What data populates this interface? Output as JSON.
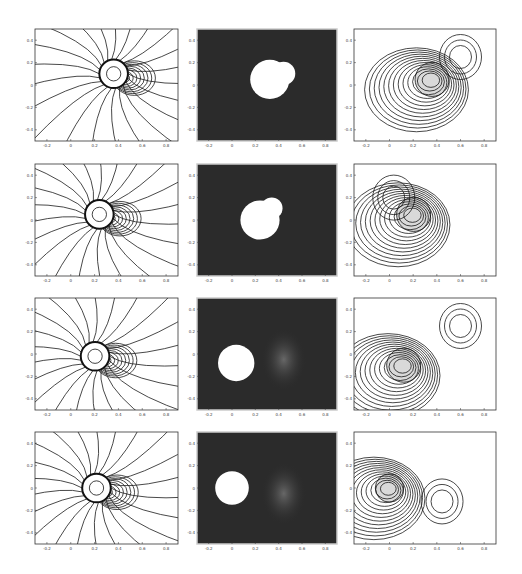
{
  "figure": {
    "layout": {
      "rows": 4,
      "cols": 3
    },
    "columns": [
      "pressure-contours",
      "visualization-image",
      "vorticity-contours"
    ],
    "axes": {
      "contour_x_ticks": [
        "-0.2",
        "0",
        "0.2",
        "0.4",
        "0.6",
        "0.8"
      ],
      "image_x_ticks": [
        "-0.2",
        "0",
        "0.2",
        "0.4",
        "0.6",
        "0.8"
      ],
      "y_ticks": [
        "0.4",
        "0.2",
        "0",
        "-0.2",
        "-0.4"
      ]
    },
    "colors": {
      "line": "#1a1a1a",
      "image_background": "#2b2b2b",
      "image_highlight": "#ffffff",
      "frame": "#333333"
    },
    "rows": [
      {
        "index": 1,
        "left": "pressure contours, cylinder near x=0.3, y=0.05",
        "middle": "bright cylinder blob at center-right",
        "right": "nested vorticity loops with upper-right lobe"
      },
      {
        "index": 2,
        "left": "pressure contours, cylinder near x=0.2, y=0",
        "middle": "cylinder with curved wake streak",
        "right": "vorticity loops with upper-left lobe"
      },
      {
        "index": 3,
        "left": "pressure contours, cylinder near x=0.05, y=-0.05",
        "middle": "cylinder with shed vortex to right",
        "right": "vorticity loops with shed lobe"
      },
      {
        "index": 4,
        "left": "pressure contours, cylinder near x=0, y=0.02",
        "middle": "cylinder at left, diffuse vortex right",
        "right": "concentric loops at cylinder plus separate vortex"
      }
    ]
  }
}
